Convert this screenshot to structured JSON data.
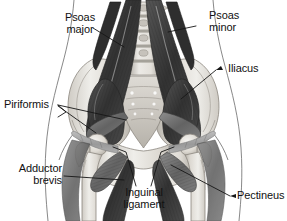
{
  "figure": {
    "type": "anatomical-illustration",
    "style": "grayscale medical illustration",
    "background_color": "#ffffff",
    "label_color": "#111111",
    "leader_line_color": "#1a1a1a",
    "bone_color": "#e8e6e2",
    "bone_shadow_color": "#b9b5ad",
    "muscle_dark_color": "#3a3a3a",
    "muscle_mid_color": "#6d6d6d",
    "muscle_light_color": "#a8a8a8",
    "outline_color": "#555555"
  },
  "labels": {
    "psoas_major": "Psoas\nmajor",
    "psoas_minor": "Psoas\nminor",
    "iliacus": "Iliacus",
    "piriformis": "Piriformis",
    "adductor_brevis": "Adductor\nbrevis",
    "inguinal_ligament": "Inguinal\nligament",
    "pectineus": "Pectineus"
  },
  "structures": [
    {
      "name": "psoas-major",
      "label": "Psoas major",
      "side": "both"
    },
    {
      "name": "psoas-minor",
      "label": "Psoas minor",
      "side": "both"
    },
    {
      "name": "iliacus",
      "label": "Iliacus",
      "side": "both"
    },
    {
      "name": "piriformis",
      "label": "Piriformis",
      "side": "both"
    },
    {
      "name": "adductor-brevis",
      "label": "Adductor brevis",
      "side": "both"
    },
    {
      "name": "inguinal-ligament",
      "label": "Inguinal ligament",
      "side": "both"
    },
    {
      "name": "pectineus",
      "label": "Pectineus",
      "side": "both"
    },
    {
      "name": "lumbar-vertebrae",
      "label": "Lumbar vertebrae",
      "side": "midline"
    },
    {
      "name": "sacrum",
      "label": "Sacrum",
      "side": "midline"
    },
    {
      "name": "ilium",
      "label": "Ilium",
      "side": "both"
    },
    {
      "name": "femur",
      "label": "Femur",
      "side": "both"
    }
  ]
}
